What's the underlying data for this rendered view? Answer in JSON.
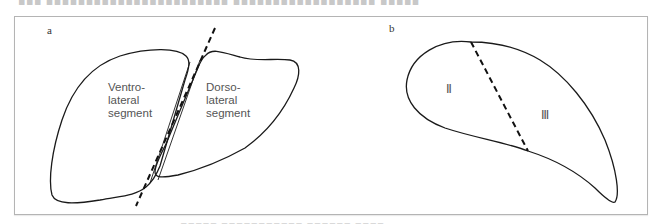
{
  "top_text_cutoff": "▪▪▪ ▪▪▪▪▪▪▪▪▪▪▪▪▪▪▪▪▪▪▪▪▪▪▪ ▪▪▪▪▪▪▪▪▪▪▪▪▪▪▪▪▪▪ ▪▪▪▪▪",
  "figure": {
    "panel_a": {
      "label": "a",
      "left_segment": {
        "line1": "Ventro-",
        "line2": "lateral",
        "line3": "segment"
      },
      "right_segment": {
        "line1": "Dorso-",
        "line2": "lateral",
        "line3": "segment"
      }
    },
    "panel_b": {
      "label": "b",
      "region_left": "Ⅱ",
      "region_right": "Ⅲ"
    }
  },
  "caption_cutoff": "▪▪▪▪▪ ▪▪▪▪▪▪▪▪▪▪▪ ▪▪▪▪▪▪ ▪▪▪▪",
  "colors": {
    "stroke": "#1a1a1a",
    "text": "#555555",
    "frame": "#b4b4b4"
  }
}
